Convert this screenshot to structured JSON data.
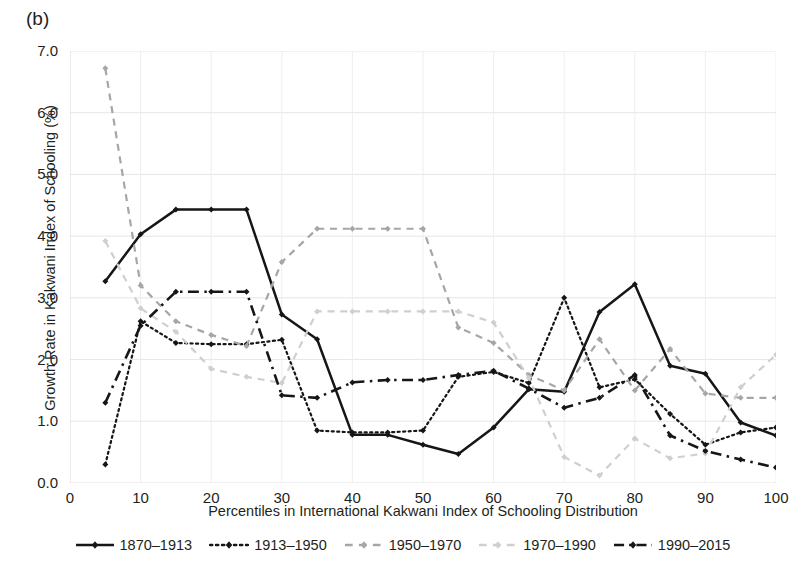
{
  "panel": {
    "label": "(b)"
  },
  "axes": {
    "ylabel": "Growth Rate in Kakwani Index of Schooling (%)",
    "xlabel": "Percentiles in International Kakwani Index of Schooling Distribution",
    "yticks": [
      "0.0",
      "1.0",
      "2.0",
      "3.0",
      "4.0",
      "5.0",
      "6.0",
      "7.0"
    ],
    "xticks": [
      "0",
      "10",
      "20",
      "30",
      "40",
      "50",
      "60",
      "70",
      "80",
      "90",
      "100"
    ]
  },
  "chart_data": {
    "type": "line",
    "title": "(b)",
    "xlabel": "Percentiles in International Kakwani Index of Schooling Distribution",
    "ylabel": "Growth Rate in Kakwani Index of Schooling (%)",
    "xlim": [
      0,
      100
    ],
    "ylim": [
      0.0,
      7.0
    ],
    "xticks": [
      0,
      10,
      20,
      30,
      40,
      50,
      60,
      70,
      80,
      90,
      100
    ],
    "yticks": [
      0.0,
      1.0,
      2.0,
      3.0,
      4.0,
      5.0,
      6.0,
      7.0
    ],
    "grid": true,
    "legend_position": "bottom",
    "x": [
      5,
      10,
      15,
      20,
      25,
      30,
      35,
      40,
      45,
      50,
      55,
      60,
      65,
      70,
      75,
      80,
      85,
      90,
      95,
      100
    ],
    "series": [
      {
        "name": "1870–1913",
        "color": "#161616",
        "style": "solid",
        "marker": "diamond",
        "values": [
          3.27,
          4.03,
          4.43,
          4.43,
          4.43,
          2.73,
          2.33,
          0.78,
          0.78,
          0.62,
          0.47,
          0.9,
          1.52,
          1.48,
          2.77,
          3.22,
          1.9,
          1.77,
          0.98,
          0.77
        ]
      },
      {
        "name": "1913–1950",
        "color": "#161616",
        "style": "dotted",
        "marker": "diamond",
        "values": [
          0.3,
          2.62,
          2.27,
          2.25,
          2.25,
          2.32,
          0.85,
          0.82,
          0.82,
          0.85,
          1.72,
          1.8,
          1.62,
          3.0,
          1.55,
          1.68,
          1.12,
          0.62,
          0.82,
          0.9
        ]
      },
      {
        "name": "1950–1970",
        "color": "#a6a6a6",
        "style": "dashed",
        "marker": "diamond",
        "values": [
          6.72,
          3.2,
          2.62,
          2.4,
          2.22,
          3.58,
          4.12,
          4.12,
          4.12,
          4.12,
          2.52,
          2.27,
          1.75,
          1.5,
          2.33,
          1.5,
          2.17,
          1.45,
          1.38,
          1.38
        ]
      },
      {
        "name": "1970–1990",
        "color": "#cfcfcf",
        "style": "dashed",
        "marker": "diamond",
        "values": [
          3.92,
          2.83,
          2.45,
          1.85,
          1.72,
          1.62,
          2.78,
          2.78,
          2.78,
          2.78,
          2.78,
          2.6,
          1.7,
          0.42,
          0.12,
          0.72,
          0.4,
          0.48,
          1.55,
          2.08
        ]
      },
      {
        "name": "1990–2015",
        "color": "#161616",
        "style": "dashdot",
        "marker": "diamond",
        "values": [
          1.3,
          2.55,
          3.1,
          3.1,
          3.1,
          1.42,
          1.38,
          1.63,
          1.67,
          1.67,
          1.75,
          1.82,
          1.53,
          1.22,
          1.38,
          1.75,
          0.77,
          0.52,
          0.38,
          0.25
        ]
      }
    ]
  },
  "legend": {
    "items": [
      {
        "label": "1870–1913"
      },
      {
        "label": "1913–1950"
      },
      {
        "label": "1950–1970"
      },
      {
        "label": "1970–1990"
      },
      {
        "label": "1990–2015"
      }
    ]
  }
}
